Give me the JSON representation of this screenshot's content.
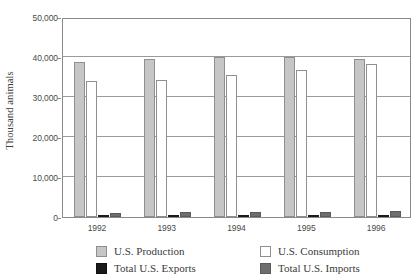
{
  "chart_data": {
    "type": "bar",
    "title": "",
    "subtitle": "",
    "xlabel": "",
    "ylabel": "Thousand animals",
    "categories": [
      "1992",
      "1993",
      "1994",
      "1995",
      "1996"
    ],
    "ylim": [
      0,
      50000
    ],
    "y_ticks": [
      0,
      10000,
      20000,
      30000,
      40000,
      50000
    ],
    "y_tick_labels": [
      "0",
      "10,000",
      "20,000",
      "30,000",
      "40,000",
      "50,000"
    ],
    "grid": true,
    "legend_position": "bottom",
    "series": [
      {
        "name": "U.S. Production",
        "color": "#c6c6c6",
        "values": [
          38800,
          39400,
          39900,
          39900,
          39600
        ]
      },
      {
        "name": "U.S. Consumption",
        "color": "#ffffff",
        "values": [
          34100,
          34300,
          35600,
          36700,
          38300
        ]
      },
      {
        "name": "Total U.S. Exports",
        "color": "#1a1a1a",
        "values": [
          350,
          400,
          400,
          300,
          350
        ]
      },
      {
        "name": "Total U.S. Imports",
        "color": "#6e6e6e",
        "values": [
          1100,
          1200,
          1200,
          1300,
          1600
        ]
      }
    ]
  },
  "legend": {
    "entries": [
      {
        "label": "U.S. Production",
        "swatch": "sw-production"
      },
      {
        "label": "U.S. Consumption",
        "swatch": "sw-consumption"
      },
      {
        "label": "Total U.S. Exports",
        "swatch": "sw-exports"
      },
      {
        "label": "Total U.S. Imports",
        "swatch": "sw-imports"
      }
    ]
  },
  "colors": {
    "production": "#c6c6c6",
    "consumption": "#ffffff",
    "exports": "#1a1a1a",
    "imports": "#6e6e6e",
    "axis": "#8a8a8a",
    "grid": "#9a9a9a",
    "text": "#3a3a3a"
  }
}
